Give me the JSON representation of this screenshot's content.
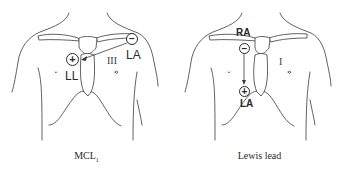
{
  "panels": [
    {
      "id": "mcl1",
      "caption": "MCL",
      "caption_sub": "1",
      "electrodes": [
        {
          "polarity": "negative",
          "symbol": "−",
          "label": "LA"
        },
        {
          "polarity": "positive",
          "symbol": "+",
          "label": "LL"
        }
      ],
      "lead_roman": "III",
      "arrow": "from negative (LA, right upper chest near shoulder) to positive (LL, right of sternum)"
    },
    {
      "id": "lewis",
      "caption": "Lewis lead",
      "electrodes": [
        {
          "polarity": "negative",
          "symbol": "−",
          "label": "RA"
        },
        {
          "polarity": "positive",
          "symbol": "+",
          "label": "LA"
        }
      ],
      "lead_roman": "I",
      "arrow": "vertical from negative (RA, below right clavicle) down to positive (LA, lower right sternal border)"
    }
  ],
  "colors": {
    "line": "#3a3a3a",
    "text": "#2a2a2a",
    "background": "#ffffff"
  }
}
